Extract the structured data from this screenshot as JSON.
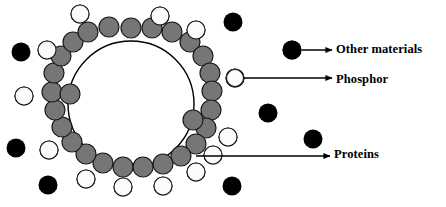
{
  "figure": {
    "width": 446,
    "height": 207,
    "background_color": "#ffffff"
  },
  "colors": {
    "protein_fill": "#767676",
    "protein_stroke": "#1a1a1a",
    "phosphor_fill": "#fbfbfb",
    "phosphor_stroke": "#1a1a1a",
    "other_material_fill": "#000000",
    "core_fill": "#ffffff",
    "core_stroke": "#000000",
    "arrow_color": "#000000",
    "text_color": "#000000"
  },
  "legend": {
    "items": [
      {
        "id": "other-materials",
        "label": "Other materials",
        "marker": "black-filled-circle",
        "marker_x": 292,
        "marker_y": 50,
        "marker_r": 9.5,
        "arrow_start_x": 302,
        "arrow_start_y": 50,
        "arrow_end_x": 332,
        "arrow_end_y": 50
      },
      {
        "id": "phosphor",
        "label": "Phosphor",
        "marker": "white-outlined-circle",
        "marker_x": 235,
        "marker_y": 78,
        "marker_r": 8.5,
        "arrow_start_x": 244,
        "arrow_start_y": 78,
        "arrow_end_x": 332,
        "arrow_end_y": 78
      },
      {
        "id": "proteins",
        "label": "Proteins",
        "marker": "gray-filled-circle",
        "marker_x": 196,
        "marker_y": 156,
        "marker_r": 0,
        "arrow_start_x": 196,
        "arrow_start_y": 156,
        "arrow_end_x": 330,
        "arrow_end_y": 156
      }
    ]
  },
  "core_particle": {
    "name": "phosphor-core-sphere",
    "center_x": 131,
    "center_y": 104,
    "radius": 63,
    "stroke_width": 1.4
  },
  "protein_shell": {
    "name": "protein-coating-ring",
    "radius": 10,
    "circles": [
      {
        "x": 131,
        "y": 28
      },
      {
        "x": 152,
        "y": 28
      },
      {
        "x": 172,
        "y": 32
      },
      {
        "x": 190,
        "y": 42
      },
      {
        "x": 203,
        "y": 56
      },
      {
        "x": 210,
        "y": 73
      },
      {
        "x": 212,
        "y": 91
      },
      {
        "x": 211,
        "y": 110
      },
      {
        "x": 206,
        "y": 128
      },
      {
        "x": 196,
        "y": 144
      },
      {
        "x": 181,
        "y": 156
      },
      {
        "x": 163,
        "y": 164
      },
      {
        "x": 143,
        "y": 167
      },
      {
        "x": 123,
        "y": 167
      },
      {
        "x": 103,
        "y": 163
      },
      {
        "x": 86,
        "y": 154
      },
      {
        "x": 72,
        "y": 142
      },
      {
        "x": 62,
        "y": 127
      },
      {
        "x": 55,
        "y": 110
      },
      {
        "x": 52,
        "y": 92
      },
      {
        "x": 54,
        "y": 73
      },
      {
        "x": 61,
        "y": 56
      },
      {
        "x": 73,
        "y": 42
      },
      {
        "x": 88,
        "y": 32
      },
      {
        "x": 109,
        "y": 27
      },
      {
        "x": 70,
        "y": 94
      },
      {
        "x": 193,
        "y": 120
      }
    ]
  },
  "phosphor_particles": {
    "name": "phosphor-outer-circles",
    "radius": 9,
    "circles": [
      {
        "x": 80,
        "y": 14
      },
      {
        "x": 47,
        "y": 50
      },
      {
        "x": 24,
        "y": 96
      },
      {
        "x": 49,
        "y": 150
      },
      {
        "x": 86,
        "y": 179
      },
      {
        "x": 123,
        "y": 187
      },
      {
        "x": 163,
        "y": 186
      },
      {
        "x": 196,
        "y": 172
      },
      {
        "x": 228,
        "y": 137
      },
      {
        "x": 235,
        "y": 78
      },
      {
        "x": 196,
        "y": 30
      },
      {
        "x": 160,
        "y": 16
      },
      {
        "x": 213,
        "y": 155
      }
    ]
  },
  "other_materials": {
    "name": "other-material-dots",
    "radius": 9.5,
    "circles": [
      {
        "x": 21,
        "y": 52
      },
      {
        "x": 16,
        "y": 148
      },
      {
        "x": 48,
        "y": 185
      },
      {
        "x": 233,
        "y": 22
      },
      {
        "x": 292,
        "y": 50
      },
      {
        "x": 268,
        "y": 113
      },
      {
        "x": 313,
        "y": 139
      },
      {
        "x": 232,
        "y": 186
      }
    ]
  }
}
